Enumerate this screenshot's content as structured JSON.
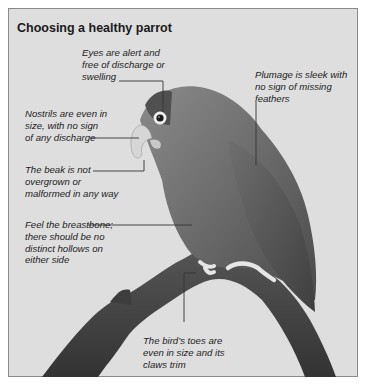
{
  "title": "Choosing a healthy parrot",
  "callouts": {
    "eyes": [
      "Eyes are alert and",
      "free of discharge or",
      "swelling"
    ],
    "plumage": [
      "Plumage is sleek with",
      "no sign of missing",
      "feathers"
    ],
    "nostrils": [
      "Nostrils are even in",
      "size, with no sign",
      "of any discharge"
    ],
    "beak": [
      "The beak is not",
      "overgrown or",
      "malformed in any way"
    ],
    "breastbone": [
      "Feel the breastbone;",
      "there should be no",
      "distinct hollows on",
      "either side"
    ],
    "toes": [
      "The bird’s toes are",
      "even in size and its",
      "claws trim"
    ]
  },
  "colors": {
    "background": "#dedede",
    "border": "#8a8a8a",
    "leader_line": "#333333"
  }
}
